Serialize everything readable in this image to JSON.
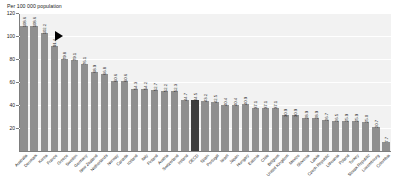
{
  "chart_data": {
    "type": "bar",
    "title": "",
    "ylabel": "Per 100 000 population",
    "xlabel": "",
    "ylim": [
      0,
      120
    ],
    "yticks": [
      0,
      20,
      40,
      60,
      80,
      100,
      120
    ],
    "ytick_labels": [
      "0",
      "20",
      "40",
      "60",
      "80",
      "100",
      "120"
    ],
    "grid": true,
    "legend": "none",
    "highlight_category": "OECD",
    "highlight_color": "#3d3d3d",
    "bar_color": "#8f8f8f",
    "plot_background": "#f2f2f2",
    "marker": {
      "name": "left-pointing-triangle",
      "color": "#000000",
      "value": 100.0,
      "near_category": "France"
    },
    "categories": [
      "Australia",
      "Denmark",
      "Korea",
      "France",
      "Greece",
      "Sweden",
      "Germany",
      "New Zealand",
      "Netherlands",
      "Norway",
      "Canada",
      "Iceland",
      "Italy",
      "Finland",
      "Austria",
      "Switzerland",
      "Ireland",
      "OECD",
      "Spain",
      "Portugal",
      "Israel",
      "Japan",
      "Hungary",
      "Estonia",
      "Chile",
      "Belgium",
      "United Kingdom",
      "Mexico",
      "Slovenia",
      "Latvia",
      "Czech Republic",
      "Lithuania",
      "Poland",
      "Turkey",
      "Slovak Republic",
      "Luxembourg",
      "Colombia"
    ],
    "values": [
      108.6,
      108.6,
      102.2,
      91.4,
      79.8,
      79.1,
      76.1,
      68.9,
      66.8,
      60.6,
      60.6,
      54.3,
      54.2,
      52.7,
      52.2,
      52.3,
      44.7,
      44.5,
      43.2,
      42.5,
      40.4,
      40.4,
      40.9,
      37.1,
      37.1,
      37.1,
      30.9,
      30.9,
      28.9,
      28.9,
      26.7,
      26.5,
      25.9,
      25.9,
      25.0,
      20.7,
      7.7
    ],
    "value_labels": [
      "108.6",
      "108.6",
      "102.2",
      "91.4",
      "79.8",
      "79.1",
      "76.1",
      "68.9",
      "66.8",
      "60.6",
      "60.6",
      "54.3",
      "54.2",
      "52.7",
      "52.2",
      "52.3",
      "44.7",
      "44.5",
      "43.2",
      "42.5",
      "40.4",
      "40.4",
      "40.9",
      "37.1",
      "37.1",
      "37.1",
      "30.9",
      "30.9",
      "28.9",
      "28.9",
      "26.7",
      "26.5",
      "25.9",
      "25.9",
      "25.0",
      "20.7",
      "7.7"
    ]
  }
}
